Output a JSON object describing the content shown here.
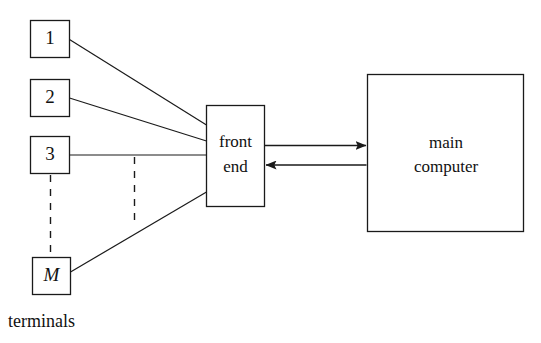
{
  "diagram": {
    "caption": "terminals",
    "stroke_color": "#1a1a1a",
    "background_color": "#ffffff",
    "terminals": [
      {
        "id": "terminal-1",
        "label": "1",
        "italic": false
      },
      {
        "id": "terminal-2",
        "label": "2",
        "italic": false
      },
      {
        "id": "terminal-3",
        "label": "3",
        "italic": false
      },
      {
        "id": "terminal-m",
        "label": "M",
        "italic": true
      }
    ],
    "front_end": {
      "id": "front-end",
      "label_line_1": "front",
      "label_line_2": "end"
    },
    "main_computer": {
      "id": "main-computer",
      "label_line_1": "main",
      "label_line_2": "computer"
    },
    "connections": [
      {
        "from": "terminal-1",
        "to": "front-end",
        "style": "solid"
      },
      {
        "from": "terminal-2",
        "to": "front-end",
        "style": "solid"
      },
      {
        "from": "terminal-3",
        "to": "front-end",
        "style": "solid"
      },
      {
        "from": "terminal-m",
        "to": "front-end",
        "style": "solid"
      },
      {
        "from": "terminal-3",
        "to": "terminal-m",
        "style": "dashed"
      },
      {
        "from": "front-end",
        "to": "main-computer",
        "style": "arrow-right"
      },
      {
        "from": "main-computer",
        "to": "front-end",
        "style": "arrow-left"
      }
    ]
  }
}
